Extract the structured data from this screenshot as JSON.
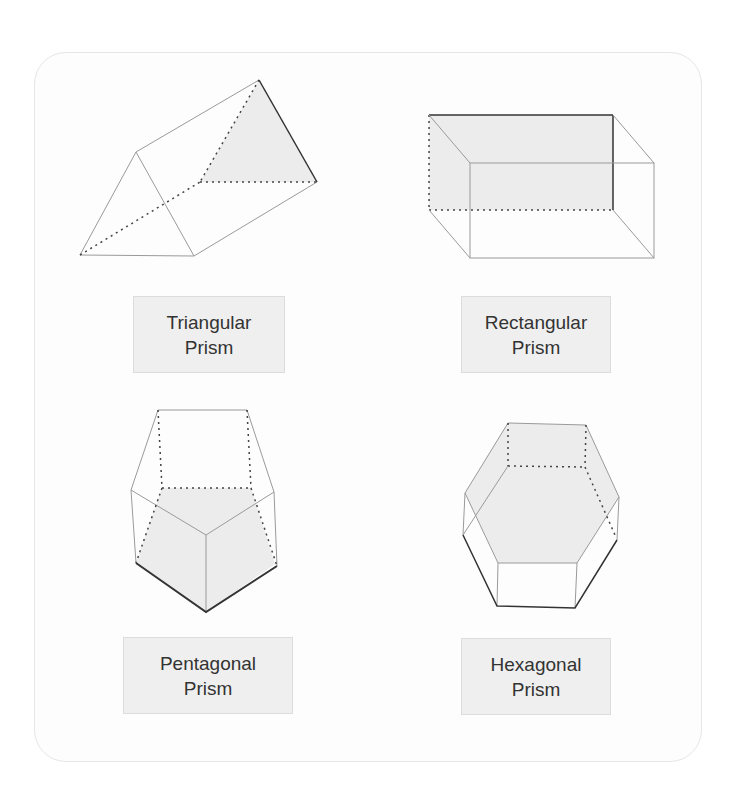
{
  "diagram": {
    "colors": {
      "face_fill": "#ececec",
      "edge": "#9a9a9a",
      "edge_dark": "#333333",
      "hidden_edge": "#444444",
      "label_bg": "#efefef",
      "label_text": "#333333"
    },
    "shapes": [
      {
        "id": "triangular",
        "label_line1": "Triangular",
        "label_line2": "Prism"
      },
      {
        "id": "rectangular",
        "label_line1": "Rectangular",
        "label_line2": "Prism"
      },
      {
        "id": "pentagonal",
        "label_line1": "Pentagonal",
        "label_line2": "Prism"
      },
      {
        "id": "hexagonal",
        "label_line1": "Hexagonal",
        "label_line2": "Prism"
      }
    ]
  }
}
